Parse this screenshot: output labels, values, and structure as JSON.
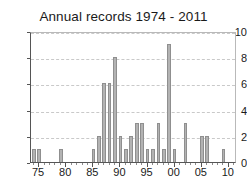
{
  "chart_data": {
    "type": "bar",
    "title": "Annual records 1974 - 2011",
    "xlabel": "",
    "ylabel": "",
    "ylim": [
      0,
      10
    ],
    "xlim": [
      1973.5,
      2011.5
    ],
    "grid": true,
    "legend": false,
    "y_ticks": [
      "0",
      "2",
      "4",
      "6",
      "8",
      "10"
    ],
    "y_tick_values": [
      0,
      2,
      4,
      6,
      8,
      10
    ],
    "x_ticks": [
      "75",
      "80",
      "85",
      "90",
      "95",
      "00",
      "05",
      "10"
    ],
    "x_tick_years": [
      1975,
      1980,
      1985,
      1990,
      1995,
      2000,
      2005,
      2010
    ],
    "categories": [
      1974,
      1975,
      1976,
      1977,
      1978,
      1979,
      1980,
      1981,
      1982,
      1983,
      1984,
      1985,
      1986,
      1987,
      1988,
      1989,
      1990,
      1991,
      1992,
      1993,
      1994,
      1995,
      1996,
      1997,
      1998,
      1999,
      2000,
      2001,
      2002,
      2003,
      2004,
      2005,
      2006,
      2007,
      2008,
      2009,
      2010,
      2011
    ],
    "values": [
      1,
      1,
      0,
      0,
      0,
      1,
      0,
      0,
      0,
      0,
      0,
      1,
      2,
      6,
      6,
      8,
      2,
      1,
      2,
      3,
      3,
      1,
      1,
      3,
      1,
      9,
      1,
      0,
      3,
      0,
      0,
      2,
      2,
      0,
      0,
      1,
      0,
      0
    ],
    "bar_color": "#b3b3b3",
    "bar_edge_color": "#8f8f8f",
    "axis_color": "#555555",
    "grid_color": "#c9c9c9",
    "background": "#ffffff"
  }
}
